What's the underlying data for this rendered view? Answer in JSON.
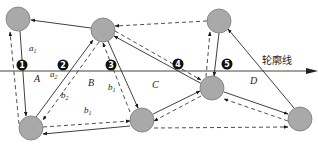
{
  "diagram": {
    "contour_label": "轮廓线",
    "regions": [
      {
        "id": "A",
        "label": "A",
        "x": 34,
        "y": 78
      },
      {
        "id": "B",
        "label": "B",
        "x": 88,
        "y": 85
      },
      {
        "id": "C",
        "label": "C",
        "x": 152,
        "y": 88
      },
      {
        "id": "D",
        "label": "D",
        "x": 250,
        "y": 83
      }
    ],
    "markers": [
      {
        "id": "1",
        "label": "1",
        "x": 22,
        "y": 65
      },
      {
        "id": "2",
        "label": "2",
        "x": 63,
        "y": 65
      },
      {
        "id": "3",
        "label": "3",
        "x": 111,
        "y": 65
      },
      {
        "id": "4",
        "label": "4",
        "x": 178,
        "y": 64
      },
      {
        "id": "5",
        "label": "5",
        "x": 227,
        "y": 64
      }
    ],
    "edge_labels": [
      {
        "id": "a1",
        "base": "a",
        "sub": "1",
        "x": 29,
        "y": 51
      },
      {
        "id": "a2",
        "base": "a",
        "sub": "2",
        "x": 50,
        "y": 77
      },
      {
        "id": "b2",
        "base": "b",
        "sub": "2",
        "x": 61,
        "y": 98
      },
      {
        "id": "b1-right",
        "base": "b",
        "sub": "1",
        "x": 108,
        "y": 90
      },
      {
        "id": "b1-bottom",
        "base": "b",
        "sub": "1",
        "x": 84,
        "y": 113
      }
    ],
    "nodes": [
      {
        "id": "n1",
        "cx": 18,
        "cy": 19,
        "r": 12
      },
      {
        "id": "n2",
        "cx": 103,
        "cy": 30,
        "r": 12
      },
      {
        "id": "n3",
        "cx": 219,
        "cy": 21,
        "r": 12
      },
      {
        "id": "n4",
        "cx": 31,
        "cy": 128,
        "r": 12
      },
      {
        "id": "n5",
        "cx": 142,
        "cy": 120,
        "r": 12
      },
      {
        "id": "n6",
        "cx": 212,
        "cy": 88,
        "r": 12
      },
      {
        "id": "n7",
        "cx": 300,
        "cy": 119,
        "r": 12
      }
    ],
    "colors": {
      "node_fill": "#a9a9a9",
      "line": "#2a2a2a",
      "marker": "#111111"
    }
  }
}
